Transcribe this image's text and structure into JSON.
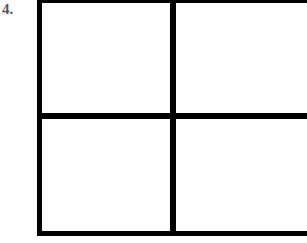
{
  "figure": {
    "label": "4.",
    "grid": {
      "rows": 2,
      "cols": 2,
      "cells": [
        {
          "row": 0,
          "col": 0,
          "content": ""
        },
        {
          "row": 0,
          "col": 1,
          "content": ""
        },
        {
          "row": 1,
          "col": 0,
          "content": ""
        },
        {
          "row": 1,
          "col": 1,
          "content": ""
        }
      ],
      "line_color": "#000000",
      "fill_color": "#ffffff"
    }
  }
}
